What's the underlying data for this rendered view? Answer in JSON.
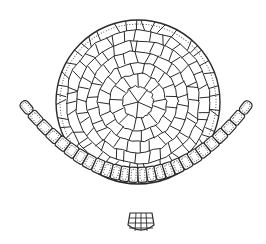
{
  "figure": {
    "background": "#ffffff",
    "stroke_color": "#2a2a2a",
    "disc": {
      "cx": 138,
      "cy": 102,
      "r": 82,
      "rings": 6
    },
    "chain": {
      "left_end": [
        22,
        102
      ],
      "bottom": [
        140,
        226
      ],
      "right_end": [
        250,
        102
      ],
      "cell_count": 26,
      "center_cluster": [
        141,
        221
      ]
    }
  }
}
